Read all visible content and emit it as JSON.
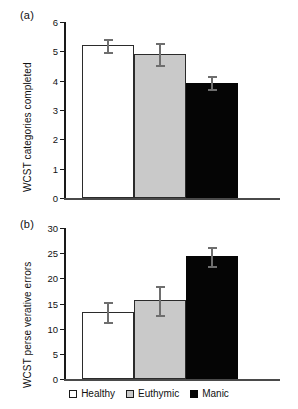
{
  "chart_data": [
    {
      "type": "bar",
      "panel_label": "(a)",
      "title": "",
      "xlabel": "",
      "ylabel": "WCST categories completed",
      "categories": [
        "Healthy",
        "Euthymic",
        "Manic"
      ],
      "values": [
        5.2,
        4.9,
        3.93
      ],
      "errors": [
        0.22,
        0.37,
        0.22
      ],
      "ylim": [
        0,
        6
      ],
      "yticks": [
        0,
        1,
        2,
        3,
        4,
        5,
        6
      ],
      "ytick_labels": [
        "0",
        "1",
        "2",
        "3",
        "4",
        "5",
        "6"
      ],
      "grid": false,
      "legend_position": "bottom"
    },
    {
      "type": "bar",
      "panel_label": "(b)",
      "title": "",
      "xlabel": "",
      "ylabel": "WCST perse verative errors",
      "categories": [
        "Healthy",
        "Euthymic",
        "Manic"
      ],
      "values": [
        13.3,
        15.6,
        24.4
      ],
      "errors": [
        2.0,
        2.9,
        1.9
      ],
      "ylim": [
        0,
        30
      ],
      "yticks": [
        0,
        5,
        10,
        15,
        20,
        25,
        30
      ],
      "ytick_labels": [
        "0",
        "5",
        "10",
        "15",
        "20",
        "25",
        "30"
      ],
      "grid": false,
      "legend_position": "bottom"
    }
  ],
  "legend": {
    "items": [
      {
        "label": "Healthy",
        "color": "#ffffff",
        "swatch": "open-square"
      },
      {
        "label": "Euthymic",
        "color": "#c9c9c9",
        "swatch": "gray-square"
      },
      {
        "label": "Manic",
        "color": "#050505",
        "swatch": "filled-square"
      }
    ]
  }
}
